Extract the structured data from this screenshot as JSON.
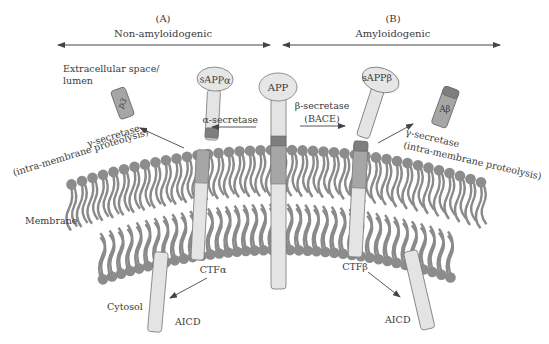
{
  "pathways": {
    "left": {
      "letter": "(A)",
      "name": "Non-amyloidogenic"
    },
    "right": {
      "letter": "(B)",
      "name": "Amyloidogenic"
    }
  },
  "regions": {
    "extracellular_line1": "Extracellular space/",
    "extracellular_line2": "lumen",
    "membrane": "Membrane",
    "cytosol": "Cytosol"
  },
  "proteins": {
    "app": "APP",
    "sappa": "sAPPα",
    "sappb": "sAPPβ",
    "p3": "p3",
    "abeta": "Aβ",
    "ctfa": "CTFα",
    "ctfb": "CTFβ",
    "aicd_left": "AICD",
    "aicd_right": "AICD"
  },
  "enzymes": {
    "alpha": "α-secretase",
    "beta_line1": "β-secretase",
    "beta_line2": "(BACE)",
    "gamma_left_line1": "γ-secretase",
    "gamma_left_line2": "(intra-membrane proteolysis)",
    "gamma_right_line1": "γ-secretase",
    "gamma_right_line2": "(intra-membrane proteolysis)"
  },
  "colors": {
    "lipid": "#8a8a8a",
    "lipid_head": "#8c8c8c",
    "protein_body": "#e4e4e4",
    "protein_mid": "#a6a6a6",
    "protein_dark": "#7e7e7e",
    "text": "#3a3a3a"
  }
}
